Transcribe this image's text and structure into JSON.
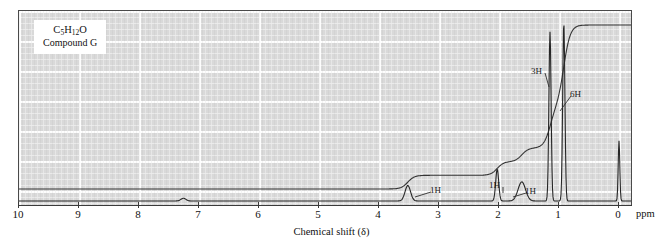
{
  "chart_data": {
    "type": "line",
    "title": "",
    "xlabel": "Chemical shift (δ)",
    "ylabel": "",
    "xunit": "ppm",
    "xlim": [
      10,
      0
    ],
    "x_reversed": true,
    "grid": true,
    "ticks": [
      {
        "value": 10,
        "label": "10"
      },
      {
        "value": 9,
        "label": "9"
      },
      {
        "value": 8,
        "label": "8"
      },
      {
        "value": 7,
        "label": "7"
      },
      {
        "value": 6,
        "label": "6"
      },
      {
        "value": 5,
        "label": "5"
      },
      {
        "value": 4,
        "label": "4"
      },
      {
        "value": 3,
        "label": "3"
      },
      {
        "value": 2,
        "label": "2"
      },
      {
        "value": 1,
        "label": "1"
      },
      {
        "value": 0,
        "label": "0"
      }
    ],
    "peaks": [
      {
        "shift": 7.26,
        "height": 0.015,
        "width": 0.05,
        "label": "",
        "note": "residual CHCl3"
      },
      {
        "shift": 3.52,
        "height": 0.085,
        "width": 0.055,
        "label": "1H"
      },
      {
        "shift": 2.03,
        "height": 0.175,
        "width": 0.03,
        "label": "1H"
      },
      {
        "shift": 1.62,
        "height": 0.105,
        "width": 0.075,
        "label": "1H"
      },
      {
        "shift": 1.15,
        "height": 0.93,
        "width": 0.022,
        "label": "3H"
      },
      {
        "shift": 0.92,
        "height": 0.98,
        "width": 0.022,
        "label": "6H"
      },
      {
        "shift": 0.0,
        "height": 0.33,
        "width": 0.016,
        "label": "",
        "note": "TMS"
      }
    ],
    "integration_steps": [
      {
        "shift": 3.52,
        "protons": 1,
        "label": "1H"
      },
      {
        "shift": 2.03,
        "protons": 1,
        "label": "1H"
      },
      {
        "shift": 1.62,
        "protons": 1,
        "label": "1H"
      },
      {
        "shift": 1.15,
        "protons": 3,
        "label": "3H"
      },
      {
        "shift": 0.92,
        "protons": 6,
        "label": "6H"
      }
    ],
    "annotations": [
      {
        "label": "1H",
        "x": 430,
        "y": 185,
        "leader_to_x": 414,
        "leader_to_y": 196
      },
      {
        "label": "1H",
        "x": 489,
        "y": 180,
        "leader_to_x": 502,
        "leader_to_y": 192
      },
      {
        "label": "1H",
        "x": 525,
        "y": 186,
        "leader_to_x": 512,
        "leader_to_y": 196
      },
      {
        "label": "3H",
        "x": 531,
        "y": 66,
        "leader_to_x": 548,
        "leader_to_y": 86
      },
      {
        "label": "6H",
        "x": 570,
        "y": 89,
        "leader_to_x": 559,
        "leader_to_y": 110
      }
    ]
  },
  "compound": {
    "formula_prefix": "C",
    "formula": "C5H12O",
    "formula_parts": [
      {
        "t": "C",
        "sub": false
      },
      {
        "t": "5",
        "sub": true
      },
      {
        "t": "H",
        "sub": false
      },
      {
        "t": "12",
        "sub": true
      },
      {
        "t": "O",
        "sub": false
      }
    ],
    "name": "Compound G"
  },
  "axis": {
    "title": "Chemical shift (δ)",
    "unit_label": "ppm"
  },
  "colors": {
    "plot_background": "#d9d9d9",
    "grid_line": "#ffffff",
    "trace": "#303030",
    "frame": "#4a4a4a",
    "text": "#111111",
    "label_box": "#ffffff"
  }
}
